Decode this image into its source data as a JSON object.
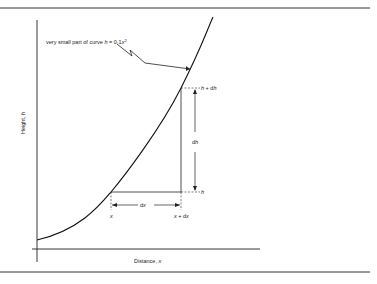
{
  "figure": {
    "annotation": "very small part of curve h = 0·1x²",
    "annotation_prefix": "very small part of curve ",
    "annotation_var": "h",
    "annotation_eq": " = 0·1",
    "annotation_x": "x",
    "annotation_sup": "2",
    "y_axis_label": "Height, h",
    "y_axis_label_text": "Height, ",
    "y_axis_label_var": "h",
    "x_axis_label": "Distance, x",
    "x_axis_label_text": "Distance, ",
    "x_axis_label_var": "x",
    "labels": {
      "h_plus_dh_var": "h",
      "h_plus_dh_rest": " + d",
      "h_plus_dh_var2": "h",
      "h_var": "h",
      "dh_d": "d",
      "dh_var": "h",
      "dx_d": "d",
      "dx_var": "x",
      "x_var": "x",
      "x_plus_dx_var": "x",
      "x_plus_dx_rest": " + d",
      "x_plus_dx_var2": "x"
    }
  },
  "colors": {
    "ink": "#222222",
    "rule": "#333333"
  }
}
